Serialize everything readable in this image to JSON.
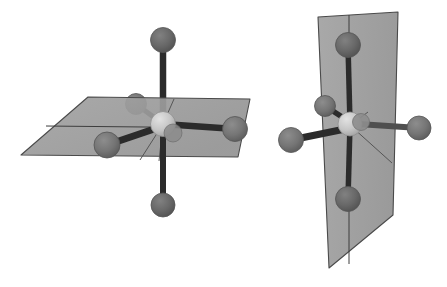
{
  "figure": {
    "background_color": "#ffffff",
    "width": 447,
    "height": 287
  },
  "palette": {
    "background": "#ffffff",
    "plane_fill": "#9a9a9a",
    "plane_fill_light": "#a4a4a4",
    "plane_edge": "#4a4a4a",
    "ligand_atom": "#7b7b7b",
    "ligand_atom_dark": "#6e6e6e",
    "ligand_atom_shadow": "#5d5d5d",
    "central_atom": "#c9c9c9",
    "central_atom_shadow": "#a8a8a8",
    "bond_dark": "#2b2b2b",
    "bond_mid": "#4f4f4f"
  },
  "panels": [
    {
      "id": "left-panel",
      "name": "horizontal-mirror-plane-model",
      "label": "Octahedral model with horizontal mirror plane",
      "plane": {
        "name": "horizontal-mirror-plane",
        "orientation": "horizontal",
        "shape": "parallelogram",
        "points": "88,97 250,99 238,157 21,155",
        "fill": "#9a9a9a",
        "opacity": 0.92,
        "seam": "46,126 243,128"
      },
      "center_atom": {
        "name": "central-atom",
        "cx": 163,
        "cy": 124,
        "r": 12.5,
        "fill": "#c9c9c9"
      },
      "ligands": [
        {
          "name": "ligand-axial-top",
          "cx": 163,
          "cy": 40,
          "r": 12.5,
          "fill": "#6e6e6e",
          "bond": "dark",
          "bond_width": 6.5
        },
        {
          "name": "ligand-axial-bottom",
          "cx": 163,
          "cy": 205,
          "r": 12.0,
          "fill": "#6a6a6a",
          "bond": "dark",
          "bond_width": 6.0
        },
        {
          "name": "ligand-equatorial-right",
          "cx": 235,
          "cy": 129,
          "r": 12.5,
          "fill": "#7b7b7b",
          "bond": "dark",
          "bond_width": 6.5
        },
        {
          "name": "ligand-equatorial-front-left",
          "cx": 107,
          "cy": 145,
          "r": 13.0,
          "fill": "#787878",
          "bond": "dark",
          "bond_width": 7.0
        },
        {
          "name": "ligand-equatorial-back-left",
          "cx": 136,
          "cy": 104,
          "r": 10.5,
          "fill": "#7a7a7a",
          "bond": "dark",
          "bond_width": 5.0
        }
      ],
      "guide_lines": [
        "163,124 171,101",
        "163,124 139,162",
        "163,124 158,163"
      ]
    },
    {
      "id": "right-panel",
      "name": "vertical-mirror-plane-model",
      "label": "Octahedral model with vertical mirror plane",
      "plane": {
        "name": "vertical-mirror-plane",
        "orientation": "vertical",
        "shape": "quadrilateral",
        "points": "318,17 398,12 393,215 329,268",
        "fill": "#9a9a9a",
        "opacity": 0.92,
        "seam": "349,15 349,264"
      },
      "center_atom": {
        "name": "central-atom",
        "cx": 350,
        "cy": 124,
        "r": 12.0,
        "fill": "#c9c9c9"
      },
      "ligands": [
        {
          "name": "ligand-axial-top",
          "cx": 348,
          "cy": 45,
          "r": 12.5,
          "fill": "#6e6e6e",
          "bond": "dark",
          "bond_width": 5.5
        },
        {
          "name": "ligand-axial-bottom",
          "cx": 348,
          "cy": 199,
          "r": 12.5,
          "fill": "#6e6e6e",
          "bond": "dark",
          "bond_width": 5.5
        },
        {
          "name": "ligand-equatorial-right",
          "cx": 419,
          "cy": 128,
          "r": 12.0,
          "fill": "#7b7b7b",
          "bond": "mid",
          "bond_width": 6.0
        },
        {
          "name": "ligand-equatorial-front-left",
          "cx": 291,
          "cy": 140,
          "r": 12.5,
          "fill": "#787878",
          "bond": "dark",
          "bond_width": 7.0
        },
        {
          "name": "ligand-equatorial-back-left",
          "cx": 325,
          "cy": 106,
          "r": 10.5,
          "fill": "#7a7a7a",
          "bond": "dark",
          "bond_width": 5.5
        }
      ],
      "near_atom": {
        "name": "ligand-front-overlap",
        "cx": 361,
        "cy": 122,
        "r": 8.5,
        "fill": "#8d8d8d"
      },
      "guide_lines": [
        "350,124 393,163",
        "350,124 366,110"
      ]
    }
  ]
}
